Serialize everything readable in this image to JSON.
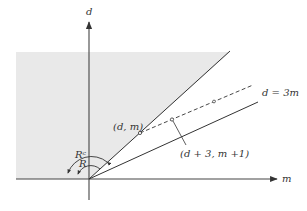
{
  "diagram": {
    "axes": {
      "vertical_label": "d",
      "horizontal_label": "m"
    },
    "lines": {
      "upper_ray_point_label": "(d, m)",
      "lower_ray_label": "d = 3m",
      "dashed_point_label": "(d + 3, m +1)"
    },
    "regions": {
      "outer_angle_label": "Rᶜ",
      "inner_angle_label": "R"
    },
    "colors": {
      "shaded_region": "#e9e9e9",
      "ink": "#333333",
      "background": "#ffffff"
    }
  }
}
